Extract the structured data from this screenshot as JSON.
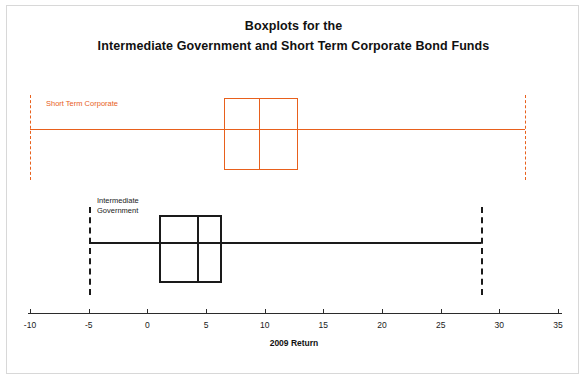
{
  "title": {
    "line1": "Boxplots for the",
    "line2": "Intermediate Government and Short Term Corporate Bond Funds"
  },
  "axis": {
    "label": "2009 Return",
    "ticks": [
      "-10",
      "-5",
      "0",
      "5",
      "10",
      "15",
      "20",
      "25",
      "30",
      "35"
    ],
    "tick_values": [
      -10,
      -5,
      0,
      5,
      10,
      15,
      20,
      25,
      30,
      35
    ],
    "min": -10,
    "max": 35
  },
  "series": [
    {
      "name": "Short Term Corporate",
      "label": "Short Term Corporate",
      "color": "#E8601C",
      "min": -10.0,
      "q1": 6.5,
      "median": 9.5,
      "q3": 12.8,
      "max": 32.2
    },
    {
      "name": "Intermediate Government",
      "label_line1": "Intermediate",
      "label_line2": "Government",
      "color": "#1a1a1a",
      "min": -5.0,
      "q1": 1.0,
      "median": 4.2,
      "q3": 6.4,
      "max": 28.4
    }
  ],
  "chart_data": {
    "type": "box",
    "title": "Boxplots for the Intermediate Government and Short Term Corporate Bond Funds",
    "xlabel": "2009 Return",
    "ylabel": "",
    "xlim": [
      -10,
      35
    ],
    "grid": false,
    "legend": "inline labels",
    "categories": [
      "Short Term Corporate",
      "Intermediate Government"
    ],
    "boxes": [
      {
        "name": "Short Term Corporate",
        "color": "#E8601C",
        "whisker_low": -10.0,
        "q1": 6.5,
        "median": 9.5,
        "q3": 12.8,
        "whisker_high": 32.2
      },
      {
        "name": "Intermediate Government",
        "color": "#1a1a1a",
        "whisker_low": -5.0,
        "q1": 1.0,
        "median": 4.2,
        "q3": 6.4,
        "whisker_high": 28.4
      }
    ],
    "xticks": [
      -10,
      -5,
      0,
      5,
      10,
      15,
      20,
      25,
      30,
      35
    ],
    "xticklabels": [
      "-10",
      "-5",
      "0",
      "5",
      "10",
      "15",
      "20",
      "25",
      "30",
      "35"
    ]
  }
}
